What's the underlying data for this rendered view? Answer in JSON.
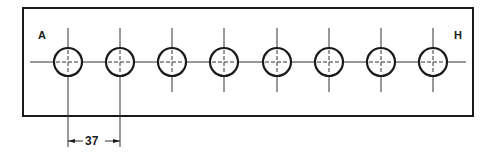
{
  "diagram": {
    "type": "hole-pattern-drawing",
    "plate": {
      "x": 23,
      "y": 8,
      "width": 450,
      "height": 108
    },
    "centerline_y": 62,
    "hole_radius": 14,
    "holes": [
      {
        "id": "A",
        "cx": 68
      },
      {
        "id": "B",
        "cx": 120
      },
      {
        "id": "C",
        "cx": 172
      },
      {
        "id": "D",
        "cx": 224
      },
      {
        "id": "E",
        "cx": 277
      },
      {
        "id": "F",
        "cx": 329
      },
      {
        "id": "G",
        "cx": 381
      },
      {
        "id": "H",
        "cx": 433
      }
    ],
    "labels": {
      "start": "A",
      "end": "H"
    },
    "dimension": {
      "value": "37",
      "from_hole": "A",
      "to_hole": "B"
    },
    "colors": {
      "line": "#1a1a1a",
      "background": "#ffffff"
    }
  }
}
